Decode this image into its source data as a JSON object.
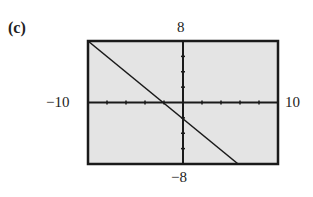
{
  "panel_label": "(c)",
  "chart_data": {
    "type": "line",
    "title": "",
    "xlabel": "",
    "ylabel": "",
    "xlim": [
      -10,
      10
    ],
    "ylim": [
      -8,
      8
    ],
    "x_ticks_spacing": 2,
    "y_ticks_spacing": 2,
    "grid": false,
    "tick_labels": {
      "xmin": "−10",
      "xmax": "10",
      "ymin": "−8",
      "ymax": "8"
    },
    "series": [
      {
        "name": "line",
        "x": [
          -10,
          5.8
        ],
        "y": [
          8,
          -8
        ],
        "approx_equation": "y = -x - 2"
      }
    ],
    "colors": {
      "background": "#e6e6e6",
      "frame": "#1a1a1a",
      "line": "#1a1a1a"
    }
  }
}
